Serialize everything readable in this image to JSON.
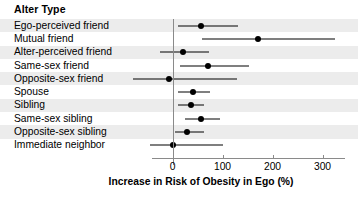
{
  "header": {
    "column_title": "Alter Type"
  },
  "axis": {
    "xlabel": "Increase in Risk of Obesity in Ego (%)",
    "ticks": [
      "0",
      "100",
      "200",
      "300"
    ],
    "tick_values": [
      0,
      100,
      200,
      300
    ]
  },
  "chart_data": {
    "type": "scatter",
    "orientation": "horizontal",
    "title": "",
    "xlabel": "Increase in Risk of Obesity in Ego (%)",
    "ylabel": "Alter Type",
    "xlim": [
      -90,
      340
    ],
    "xticks": [
      0,
      100,
      200,
      300
    ],
    "grid": false,
    "legend": "none",
    "reference_line": 0,
    "categories": [
      "Ego-perceived friend",
      "Mutual friend",
      "Alter-perceived friend",
      "Same-sex friend",
      "Opposite-sex friend",
      "Spouse",
      "Sibling",
      "Same-sex sibling",
      "Opposite-sex sibling",
      "Immediate neighbor"
    ],
    "series": [
      {
        "name": "Increase in Risk of Obesity in Ego (%)",
        "values": [
          57,
          171,
          20,
          71,
          -7,
          40,
          36,
          56,
          28,
          0
        ],
        "ci_low": [
          10,
          59,
          -25,
          15,
          -80,
          10,
          11,
          25,
          5,
          -45
        ],
        "ci_high": [
          130,
          325,
          73,
          152,
          128,
          75,
          63,
          95,
          62,
          100
        ]
      }
    ]
  },
  "rows": [
    {
      "label": "Ego-perceived friend",
      "value": 57,
      "low": 10,
      "high": 130,
      "shaded": true
    },
    {
      "label": "Mutual friend",
      "value": 171,
      "low": 59,
      "high": 325,
      "shaded": false
    },
    {
      "label": "Alter-perceived friend",
      "value": 20,
      "low": -25,
      "high": 73,
      "shaded": true
    },
    {
      "label": "Same-sex friend",
      "value": 71,
      "low": 15,
      "high": 152,
      "shaded": false
    },
    {
      "label": "Opposite-sex friend",
      "value": -7,
      "low": -80,
      "high": 128,
      "shaded": true
    },
    {
      "label": "Spouse",
      "value": 40,
      "low": 10,
      "high": 75,
      "shaded": false
    },
    {
      "label": "Sibling",
      "value": 36,
      "low": 11,
      "high": 63,
      "shaded": true
    },
    {
      "label": "Same-sex sibling",
      "value": 56,
      "low": 25,
      "high": 95,
      "shaded": false
    },
    {
      "label": "Opposite-sex sibling",
      "value": 28,
      "low": 5,
      "high": 62,
      "shaded": true
    },
    {
      "label": "Immediate neighbor",
      "value": 0,
      "low": -45,
      "high": 100,
      "shaded": false
    }
  ],
  "colors": {
    "point": "#000000",
    "ci": "#000000",
    "axis": "#8a8a8a",
    "row_shade": "#ececec",
    "background": "#ffffff",
    "text": "#000000"
  }
}
